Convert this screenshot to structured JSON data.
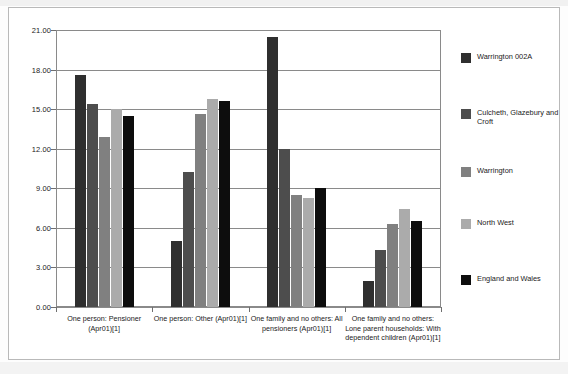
{
  "chart_data": {
    "type": "bar",
    "title": "",
    "xlabel": "",
    "ylabel": "",
    "ylim": [
      0,
      21
    ],
    "ytick_step": 3,
    "ytick_labels": [
      "21.00",
      "18.00",
      "15.00",
      "12.00",
      "9.00",
      "6.00",
      "3.00",
      "0.00"
    ],
    "ytick_values": [
      21,
      18,
      15,
      12,
      9,
      6,
      3,
      0
    ],
    "grid": true,
    "legend_position": "right",
    "categories": [
      "One person: Pensioner (Apr01)[1]",
      "One person: Other (Apr01)[1]",
      "One family and no others: All pensioners (Apr01)[1]",
      "One family and no others: Lone parent households: With dependent children (Apr01)[1]"
    ],
    "series": [
      {
        "name": "Warrington 002A",
        "color": "#2f2f2f",
        "values": [
          17.6,
          5.0,
          20.5,
          2.0
        ]
      },
      {
        "name": "Culcheth, Glazebury and Croft",
        "color": "#4d4d4d",
        "values": [
          15.4,
          10.2,
          12.0,
          4.3
        ]
      },
      {
        "name": "Warrington",
        "color": "#808080",
        "values": [
          12.9,
          14.6,
          8.5,
          6.3
        ]
      },
      {
        "name": "North West",
        "color": "#ababab",
        "values": [
          15.0,
          15.8,
          8.3,
          7.4
        ]
      },
      {
        "name": "England and Wales",
        "color": "#0d0d0d",
        "values": [
          14.5,
          15.6,
          9.0,
          6.5
        ]
      }
    ]
  }
}
